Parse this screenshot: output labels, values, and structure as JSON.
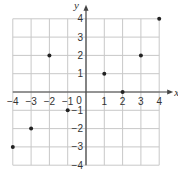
{
  "chart_data": {
    "type": "scatter",
    "title": "",
    "xlabel": "x",
    "ylabel": "y",
    "xlim": [
      -4,
      4
    ],
    "ylim": [
      -4,
      4
    ],
    "grid": true,
    "x_ticks": [
      "-4",
      "-3",
      "-2",
      "-1",
      "1",
      "2",
      "3",
      "4"
    ],
    "y_ticks": [
      "4",
      "3",
      "2",
      "1",
      "-1",
      "-2",
      "-3",
      "-4"
    ],
    "origin_label": "0",
    "points": [
      {
        "x": -4,
        "y": -3
      },
      {
        "x": -3,
        "y": -2
      },
      {
        "x": -2,
        "y": 2
      },
      {
        "x": -1,
        "y": -1
      },
      {
        "x": 1,
        "y": 1
      },
      {
        "x": 2,
        "y": 0
      },
      {
        "x": 3,
        "y": 2
      },
      {
        "x": 4,
        "y": 4
      }
    ]
  }
}
